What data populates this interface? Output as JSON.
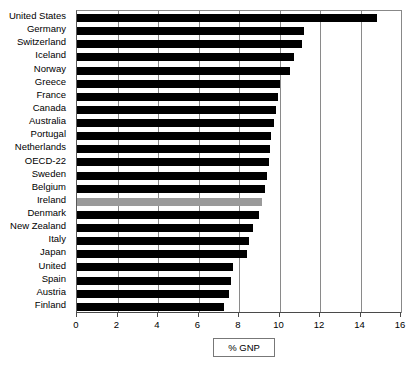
{
  "chart_data": {
    "type": "bar",
    "orientation": "horizontal",
    "title": "",
    "xlabel": "% GNP",
    "ylabel": "",
    "xlim": [
      0,
      16
    ],
    "xticks": [
      0,
      2,
      4,
      6,
      8,
      10,
      12,
      14,
      16
    ],
    "grid": true,
    "legend": null,
    "categories": [
      "United States",
      "Germany",
      "Switzerland",
      "Iceland",
      "Norway",
      "Greece",
      "France",
      "Canada",
      "Australia",
      "Portugal",
      "Netherlands",
      "OECD-22",
      "Sweden",
      "Belgium",
      "Ireland",
      "Denmark",
      "New Zealand",
      "Italy",
      "Japan",
      "United",
      "Spain",
      "Austria",
      "Finland"
    ],
    "values": [
      14.8,
      11.2,
      11.1,
      10.7,
      10.5,
      10.0,
      9.95,
      9.85,
      9.75,
      9.6,
      9.55,
      9.5,
      9.4,
      9.3,
      9.15,
      9.0,
      8.7,
      8.5,
      8.4,
      7.7,
      7.6,
      7.5,
      7.25
    ],
    "highlight_category": "Ireland",
    "colors": {
      "bar": "#000000",
      "highlight_bar": "#9a9a9a",
      "grid": "#8a8a8a",
      "axis": "#4a4a4a",
      "background": "#ffffff"
    }
  },
  "axis_title": {
    "label": "% GNP"
  }
}
